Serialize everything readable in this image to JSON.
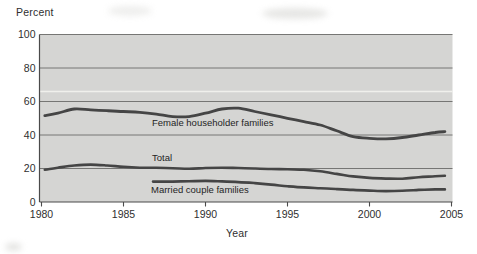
{
  "figure": {
    "background_color": "#ffffff",
    "plot_background_color": "#d5d5d3",
    "grid_color": "#767674",
    "axis_color": "#4a4a4a",
    "series_color": "#454545",
    "text_color": "#2f2f2f",
    "white_scan_band_color": "#f3f3ef"
  },
  "chart_data": {
    "type": "line",
    "title": "",
    "xlabel": "Year",
    "ylabel": "Percent",
    "xlim": [
      1980,
      2005
    ],
    "ylim": [
      0,
      100
    ],
    "x_ticks": [
      "1980",
      "1985",
      "1990",
      "1995",
      "2000",
      "2005"
    ],
    "x_tick_years": [
      1980,
      1985,
      1990,
      1995,
      2000,
      2005
    ],
    "y_ticks": [
      "0",
      "20",
      "40",
      "60",
      "80",
      "100"
    ],
    "y_tick_values": [
      0,
      20,
      40,
      60,
      80,
      100
    ],
    "grid": "horizontal-dark-lines-on-gray-band",
    "legend": "inline-labels-below-lines",
    "white_scan_line_percent": 66,
    "series": [
      {
        "name": "Female householder families",
        "x": [
          1980.2,
          1981,
          1982,
          1983,
          1984,
          1985,
          1986,
          1987,
          1988,
          1989,
          1990,
          1991,
          1992,
          1993,
          1994,
          1995,
          1996,
          1997,
          1998,
          1999,
          2000,
          2001,
          2002,
          2003,
          2004,
          2004.6
        ],
        "y": [
          51.5,
          53.0,
          55.5,
          55.0,
          54.5,
          54.0,
          53.5,
          52.5,
          51.0,
          51.0,
          53.0,
          55.5,
          56.0,
          54.0,
          52.0,
          50.0,
          48.0,
          46.0,
          42.5,
          39.0,
          38.0,
          37.7,
          38.5,
          40.0,
          41.5,
          42.0
        ]
      },
      {
        "name": "Total",
        "x": [
          1980.2,
          1981,
          1982,
          1983,
          1984,
          1985,
          1986,
          1987,
          1988,
          1989,
          1990,
          1991,
          1992,
          1993,
          1994,
          1995,
          1996,
          1997,
          1998,
          1999,
          2000,
          2001,
          2002,
          2003,
          2004,
          2004.6
        ],
        "y": [
          19.3,
          20.5,
          21.8,
          22.3,
          21.8,
          21.0,
          20.5,
          20.4,
          20.2,
          19.8,
          20.3,
          20.5,
          20.3,
          20.0,
          19.7,
          19.5,
          19.2,
          18.3,
          16.8,
          15.3,
          14.4,
          14.0,
          13.9,
          14.8,
          15.4,
          15.7
        ]
      },
      {
        "name": "Married couple families",
        "x": [
          1986.8,
          1987,
          1988,
          1989,
          1990,
          1991,
          1992,
          1993,
          1994,
          1995,
          1996,
          1997,
          1998,
          1999,
          2000,
          2001,
          2002,
          2003,
          2004,
          2004.6
        ],
        "y": [
          12.2,
          12.2,
          12.2,
          12.4,
          12.6,
          12.3,
          11.9,
          11.3,
          10.4,
          9.4,
          8.7,
          8.2,
          7.7,
          7.2,
          6.8,
          6.5,
          6.7,
          7.2,
          7.5,
          7.5
        ]
      }
    ]
  }
}
